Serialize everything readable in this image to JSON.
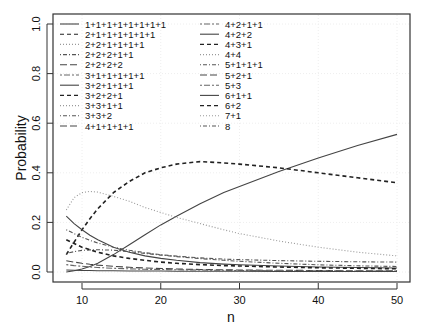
{
  "chart_data": {
    "type": "line",
    "title": "",
    "xlabel": "n",
    "ylabel": "Probability",
    "xlim": [
      7,
      51
    ],
    "ylim": [
      0,
      1.0
    ],
    "x_ticks": [
      10,
      20,
      30,
      40,
      50
    ],
    "x_tick_labels": [
      "10",
      "20",
      "30",
      "40",
      "50"
    ],
    "y_ticks": [
      0.0,
      0.2,
      0.4,
      0.6,
      0.8,
      1.0
    ],
    "y_tick_labels": [
      "0.0",
      "0.2",
      "0.4",
      "0.6",
      "0.8",
      "1.0"
    ],
    "grid": true,
    "legend_position": "top-left, two columns",
    "legend": [
      {
        "label": "1+1+1+1+1+1+1+1",
        "style": "solid"
      },
      {
        "label": "2+1+1+1+1+1+1",
        "style": "dashed"
      },
      {
        "label": "2+2+1+1+1+1",
        "style": "dotted"
      },
      {
        "label": "2+2+2+1+1",
        "style": "dotdash"
      },
      {
        "label": "2+2+2+2",
        "style": "longdash"
      },
      {
        "label": "3+1+1+1+1+1",
        "style": "twodash"
      },
      {
        "label": "3+2+1+1+1",
        "style": "solid"
      },
      {
        "label": "3+2+2+1",
        "style": "dashed"
      },
      {
        "label": "3+3+1+1",
        "style": "dotted"
      },
      {
        "label": "3+3+2",
        "style": "dotdash"
      },
      {
        "label": "4+1+1+1+1",
        "style": "longdash"
      },
      {
        "label": "4+2+1+1",
        "style": "twodash"
      },
      {
        "label": "4+2+2",
        "style": "solid"
      },
      {
        "label": "4+3+1",
        "style": "dashed"
      },
      {
        "label": "4+4",
        "style": "dotted"
      },
      {
        "label": "5+1+1+1",
        "style": "dotdash"
      },
      {
        "label": "5+2+1",
        "style": "longdash"
      },
      {
        "label": "5+3",
        "style": "twodash"
      },
      {
        "label": "6+1+1",
        "style": "solid"
      },
      {
        "label": "6+2",
        "style": "dashed"
      },
      {
        "label": "7+1",
        "style": "dotted"
      },
      {
        "label": "8",
        "style": "dotdash"
      }
    ],
    "x": [
      8,
      9,
      10,
      11,
      12,
      14,
      16,
      18,
      20,
      22,
      25,
      28,
      30,
      35,
      40,
      45,
      50
    ],
    "series": [
      {
        "name": "rising solid",
        "style": "solid",
        "values": [
          0.0,
          0.005,
          0.012,
          0.022,
          0.035,
          0.07,
          0.11,
          0.15,
          0.19,
          0.225,
          0.275,
          0.32,
          0.345,
          0.405,
          0.46,
          0.51,
          0.555
        ]
      },
      {
        "name": "dashed hump",
        "style": "dashed",
        "values": [
          0.07,
          0.12,
          0.17,
          0.215,
          0.255,
          0.32,
          0.365,
          0.4,
          0.42,
          0.435,
          0.445,
          0.44,
          0.435,
          0.42,
          0.4,
          0.38,
          0.36
        ]
      },
      {
        "name": "dotted hump",
        "style": "dotted",
        "values": [
          0.25,
          0.3,
          0.32,
          0.325,
          0.322,
          0.305,
          0.285,
          0.26,
          0.24,
          0.22,
          0.195,
          0.17,
          0.155,
          0.125,
          0.1,
          0.08,
          0.065
        ]
      },
      {
        "name": "falling solid",
        "style": "solid",
        "values": [
          0.225,
          0.195,
          0.17,
          0.148,
          0.13,
          0.1,
          0.08,
          0.065,
          0.055,
          0.047,
          0.038,
          0.032,
          0.029,
          0.024,
          0.02,
          0.018,
          0.016
        ]
      },
      {
        "name": "falling dotdash",
        "style": "dotdash",
        "values": [
          0.17,
          0.155,
          0.14,
          0.128,
          0.117,
          0.1,
          0.088,
          0.078,
          0.07,
          0.064,
          0.057,
          0.052,
          0.05,
          0.046,
          0.043,
          0.041,
          0.04
        ]
      },
      {
        "name": "hump dotdash",
        "style": "dotdash",
        "values": [
          0.075,
          0.082,
          0.087,
          0.089,
          0.09,
          0.088,
          0.082,
          0.075,
          0.068,
          0.062,
          0.054,
          0.047,
          0.043,
          0.035,
          0.029,
          0.025,
          0.022
        ]
      },
      {
        "name": "falling dashed",
        "style": "dashed",
        "values": [
          0.13,
          0.115,
          0.1,
          0.09,
          0.08,
          0.065,
          0.055,
          0.047,
          0.04,
          0.035,
          0.03,
          0.026,
          0.024,
          0.02,
          0.017,
          0.015,
          0.013
        ]
      },
      {
        "name": "low longdash",
        "style": "longdash",
        "values": [
          0.045,
          0.04,
          0.035,
          0.031,
          0.028,
          0.023,
          0.019,
          0.016,
          0.014,
          0.012,
          0.01,
          0.009,
          0.008,
          0.007,
          0.006,
          0.005,
          0.005
        ]
      },
      {
        "name": "low twodash",
        "style": "twodash",
        "values": [
          0.03,
          0.026,
          0.023,
          0.02,
          0.018,
          0.015,
          0.013,
          0.011,
          0.01,
          0.009,
          0.008,
          0.007,
          0.006,
          0.005,
          0.005,
          0.004,
          0.004
        ]
      },
      {
        "name": "near-zero group",
        "style": "solid",
        "values": [
          0.008,
          0.007,
          0.006,
          0.006,
          0.005,
          0.005,
          0.004,
          0.004,
          0.004,
          0.003,
          0.003,
          0.003,
          0.003,
          0.002,
          0.002,
          0.002,
          0.002
        ]
      }
    ]
  }
}
